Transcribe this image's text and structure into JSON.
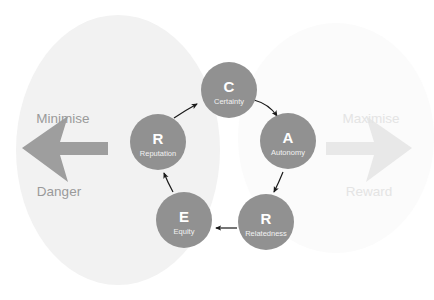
{
  "diagram": {
    "background_color": "#ffffff",
    "node_fill": "#919191",
    "node_text_color": "#ffffff",
    "node_subtext_color": "#f2f2f2",
    "left_ellipse_color": "#f2f2f2",
    "right_ellipse_color": "#fafafa",
    "left_arrow_color": "#9e9e9e",
    "right_arrow_color": "#e8e8e8",
    "cycle_arrow_color": "#1a1a1a",
    "nodes": [
      {
        "id": "certainty",
        "letter": "C",
        "word": "Certainty",
        "cx": 229,
        "cy": 90,
        "r": 28
      },
      {
        "id": "autonomy",
        "letter": "A",
        "word": "Autonomy",
        "cx": 288,
        "cy": 141,
        "r": 28
      },
      {
        "id": "relatedness",
        "letter": "R",
        "word": "Relatedness",
        "cx": 266,
        "cy": 222,
        "r": 28
      },
      {
        "id": "equity",
        "letter": "E",
        "word": "Equity",
        "cx": 184,
        "cy": 220,
        "r": 28
      },
      {
        "id": "reputation",
        "letter": "R",
        "word": "Reputation",
        "cx": 158,
        "cy": 142,
        "r": 28
      }
    ],
    "left_side": {
      "top_label": "Minimise",
      "bottom_label": "Danger",
      "direction": "left"
    },
    "right_side": {
      "top_label": "Maximise",
      "bottom_label": "Reward",
      "direction": "right"
    }
  }
}
